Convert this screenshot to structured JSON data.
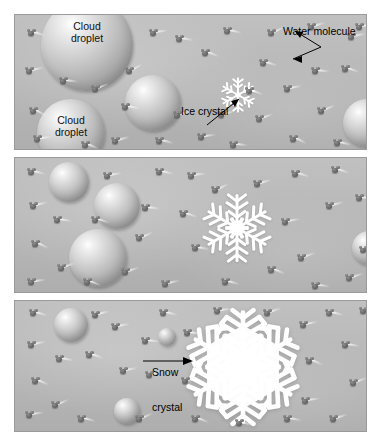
{
  "figure": {
    "background_color": "#ffffff",
    "panel_background_color": "#b9b9b9",
    "panel_border_color": "#9a9a9a",
    "molecule_color": "#5c5c5c",
    "droplet_color": "#cfcfcf",
    "crystal_color": "#ffffff"
  },
  "panels": [
    {
      "id": "panel-1",
      "stage": "initial",
      "labels": [
        {
          "name": "cloud-droplet-label-top",
          "text": "Cloud\ndroplet",
          "line1": "Cloud",
          "line2": "droplet"
        },
        {
          "name": "cloud-droplet-label-bottom",
          "text": "Cloud\ndroplet",
          "line1": "Cloud",
          "line2": "droplet"
        },
        {
          "name": "water-molecule-label",
          "text": "Water molecule"
        },
        {
          "name": "ice-crystal-label",
          "text": "Ice crystal"
        }
      ],
      "droplets": [
        {
          "cx": 72,
          "cy": 30,
          "r": 46,
          "label": "Cloud droplet"
        },
        {
          "cx": 56,
          "cy": 118,
          "r": 34,
          "label": "Cloud droplet"
        },
        {
          "cx": 138,
          "cy": 88,
          "r": 28,
          "label": ""
        },
        {
          "cx": 352,
          "cy": 108,
          "r": 24,
          "label": ""
        }
      ],
      "crystal": {
        "cx": 223,
        "cy": 80,
        "size": 40,
        "kind": "ice-crystal"
      },
      "molecule_count": 36
    },
    {
      "id": "panel-2",
      "stage": "growing",
      "labels": [],
      "droplets": [
        {
          "cx": 54,
          "cy": 24,
          "r": 20,
          "label": ""
        },
        {
          "cx": 102,
          "cy": 48,
          "r": 23,
          "label": ""
        },
        {
          "cx": 83,
          "cy": 100,
          "r": 29,
          "label": ""
        },
        {
          "cx": 354,
          "cy": 90,
          "r": 17,
          "label": ""
        }
      ],
      "crystal": {
        "cx": 222,
        "cy": 70,
        "size": 72,
        "kind": "snow-crystal-medium"
      },
      "molecule_count": 36
    },
    {
      "id": "panel-3",
      "stage": "mature",
      "labels": [
        {
          "name": "snow-crystal-label",
          "text": "Snow\ncrystal",
          "line1": "Snow",
          "line2": "crystal"
        }
      ],
      "droplets": [
        {
          "cx": 56,
          "cy": 24,
          "r": 17,
          "label": ""
        },
        {
          "cx": 152,
          "cy": 36,
          "r": 9,
          "label": ""
        },
        {
          "cx": 112,
          "cy": 110,
          "r": 13,
          "label": ""
        }
      ],
      "crystal": {
        "cx": 228,
        "cy": 66,
        "size": 116,
        "kind": "snow-crystal-large"
      },
      "molecule_count": 38
    }
  ],
  "callouts": {
    "water_molecule": "Water molecule",
    "ice_crystal": "Ice crystal",
    "snow_crystal_line1": "Snow",
    "snow_crystal_line2": "crystal",
    "cloud_droplet_line1": "Cloud",
    "cloud_droplet_line2": "droplet"
  }
}
